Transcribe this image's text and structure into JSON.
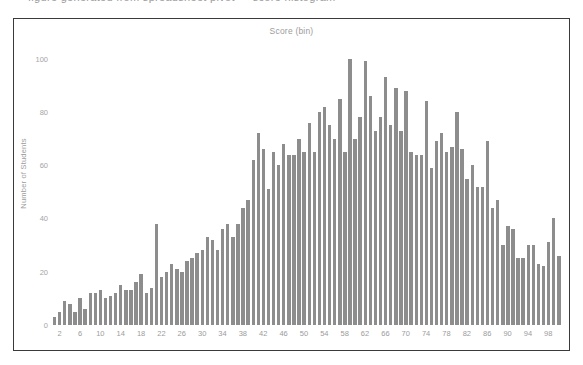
{
  "top_strip": {
    "cut_text": "figure generated from spreadsheet pivot  —  score histogram"
  },
  "chart_data": {
    "type": "bar",
    "title": "Score (bin)",
    "xlabel": "",
    "ylabel": "Number of Students",
    "ylim": [
      0,
      110
    ],
    "yticks": [
      0,
      20,
      40,
      60,
      80,
      100
    ],
    "xticks": [
      2,
      6,
      10,
      14,
      18,
      22,
      26,
      30,
      34,
      38,
      42,
      46,
      50,
      54,
      58,
      62,
      66,
      70,
      74,
      78,
      82,
      86,
      90,
      94,
      98
    ],
    "grid": false,
    "legend": false,
    "bar_color": "#8d8d8d",
    "categories": [
      1,
      2,
      3,
      4,
      5,
      6,
      7,
      8,
      9,
      10,
      11,
      12,
      13,
      14,
      15,
      16,
      17,
      18,
      19,
      20,
      21,
      22,
      23,
      24,
      25,
      26,
      27,
      28,
      29,
      30,
      31,
      32,
      33,
      34,
      35,
      36,
      37,
      38,
      39,
      40,
      41,
      42,
      43,
      44,
      45,
      46,
      47,
      48,
      49,
      50,
      51,
      52,
      53,
      54,
      55,
      56,
      57,
      58,
      59,
      60,
      61,
      62,
      63,
      64,
      65,
      66,
      67,
      68,
      69,
      70,
      71,
      72,
      73,
      74,
      75,
      76,
      77,
      78,
      79,
      80,
      81,
      82,
      83,
      84,
      85,
      86,
      87,
      88,
      89,
      90,
      91,
      92,
      93,
      94,
      95,
      96,
      97,
      98,
      99,
      100
    ],
    "values": [
      3,
      5,
      9,
      8,
      5,
      10,
      6,
      12,
      12,
      13,
      10,
      11,
      12,
      15,
      13,
      13,
      16,
      19,
      12,
      14,
      38,
      18,
      20,
      23,
      21,
      20,
      24,
      25,
      27,
      28,
      33,
      32,
      28,
      36,
      38,
      33,
      38,
      44,
      47,
      62,
      72,
      66,
      51,
      65,
      60,
      68,
      64,
      64,
      70,
      65,
      76,
      65,
      80,
      82,
      75,
      70,
      85,
      65,
      100,
      70,
      78,
      99,
      86,
      73,
      78,
      93,
      75,
      89,
      73,
      88,
      65,
      64,
      64,
      84,
      59,
      69,
      72,
      65,
      67,
      80,
      66,
      55,
      60,
      52,
      52,
      69,
      44,
      47,
      30,
      37,
      36,
      25,
      25,
      30,
      30,
      23,
      22,
      31,
      40,
      26
    ]
  }
}
